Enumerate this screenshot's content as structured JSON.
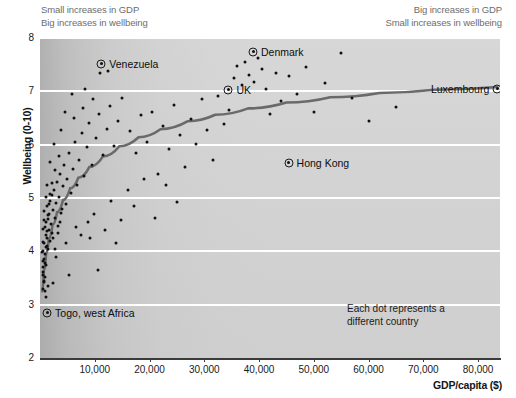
{
  "chart_data": {
    "type": "scatter",
    "title": "",
    "xlabel": "GDP/capita ($)",
    "ylabel": "Wellbeing (0-10)",
    "xlim": [
      0,
      84000
    ],
    "ylim": [
      2,
      8
    ],
    "grid": true,
    "xticks": [
      10000,
      20000,
      30000,
      40000,
      50000,
      60000,
      70000,
      80000
    ],
    "xticklabels": [
      "10,000",
      "20,000",
      "30,000",
      "40,000",
      "50,000",
      "60,000",
      "70,000",
      "80,000"
    ],
    "yticks": [
      2,
      3,
      4,
      5,
      6,
      7,
      8
    ],
    "yticklabels": [
      "2",
      "3",
      "4",
      "5",
      "6",
      "7",
      "8"
    ],
    "annotations": {
      "top_left": [
        "Small increases in GDP",
        "Big increases in wellbeing"
      ],
      "top_right": [
        "Big increases in GDP",
        "Small increases in wellbeing"
      ],
      "footnote": [
        "Each dot represents a",
        "different country"
      ]
    },
    "highlighted_points": [
      {
        "label": "Venezuela",
        "x": 11200,
        "y": 7.52,
        "label_side": "right"
      },
      {
        "label": "Denkmark_typo_fix",
        "x": 38900,
        "y": 7.74,
        "label_side": "right"
      },
      {
        "label": "UK",
        "x": 34400,
        "y": 7.03,
        "label_side": "right"
      },
      {
        "label": "Hong Kong",
        "x": 45400,
        "y": 5.66,
        "label_side": "right"
      },
      {
        "label": "Luxembourg",
        "x": 83500,
        "y": 7.05,
        "label_side": "left"
      },
      {
        "label": "Togo, west Africa",
        "x": 1300,
        "y": 2.85,
        "label_side": "right"
      }
    ],
    "highlighted_labels": [
      "Venezuela",
      "Denmark",
      "UK",
      "Hong Kong",
      "Luxembourg",
      "Togo, west Africa"
    ],
    "trend_curve": {
      "description": "logarithmic best-fit",
      "points": [
        [
          400,
          3.25
        ],
        [
          700,
          3.62
        ],
        [
          1100,
          3.95
        ],
        [
          1600,
          4.23
        ],
        [
          2300,
          4.5
        ],
        [
          3100,
          4.73
        ],
        [
          4200,
          4.96
        ],
        [
          5500,
          5.18
        ],
        [
          7000,
          5.38
        ],
        [
          9000,
          5.58
        ],
        [
          11500,
          5.78
        ],
        [
          14500,
          5.97
        ],
        [
          18000,
          6.14
        ],
        [
          22000,
          6.29
        ],
        [
          27000,
          6.44
        ],
        [
          32000,
          6.56
        ],
        [
          38000,
          6.68
        ],
        [
          45000,
          6.79
        ],
        [
          53000,
          6.89
        ],
        [
          62000,
          6.97
        ],
        [
          72000,
          7.03
        ],
        [
          83500,
          7.08
        ]
      ]
    },
    "points": [
      [
        500,
        3.3
      ],
      [
        600,
        3.55
      ],
      [
        550,
        3.7
      ],
      [
        700,
        3.85
      ],
      [
        620,
        4.0
      ],
      [
        800,
        3.45
      ],
      [
        900,
        3.95
      ],
      [
        750,
        4.15
      ],
      [
        1000,
        4.3
      ],
      [
        850,
        4.45
      ],
      [
        1100,
        3.75
      ],
      [
        1200,
        4.1
      ],
      [
        1050,
        4.55
      ],
      [
        1300,
        4.25
      ],
      [
        1400,
        4.6
      ],
      [
        1250,
        4.85
      ],
      [
        1500,
        4.05
      ],
      [
        1600,
        4.4
      ],
      [
        1700,
        4.7
      ],
      [
        1800,
        4.95
      ],
      [
        1900,
        4.2
      ],
      [
        2000,
        4.52
      ],
      [
        2100,
        5.05
      ],
      [
        2200,
        4.35
      ],
      [
        2300,
        4.78
      ],
      [
        2500,
        5.15
      ],
      [
        2700,
        4.62
      ],
      [
        2900,
        4.9
      ],
      [
        3100,
        5.3
      ],
      [
        3300,
        4.48
      ],
      [
        3500,
        5.02
      ],
      [
        3700,
        5.45
      ],
      [
        3900,
        4.72
      ],
      [
        4100,
        5.22
      ],
      [
        4400,
        5.62
      ],
      [
        4700,
        4.88
      ],
      [
        5000,
        5.35
      ],
      [
        5300,
        5.85
      ],
      [
        5600,
        5.1
      ],
      [
        6000,
        5.55
      ],
      [
        6400,
        6.05
      ],
      [
        6800,
        5.25
      ],
      [
        7200,
        5.72
      ],
      [
        7600,
        6.22
      ],
      [
        8000,
        5.42
      ],
      [
        8500,
        5.95
      ],
      [
        9000,
        6.4
      ],
      [
        9500,
        5.62
      ],
      [
        10200,
        6.12
      ],
      [
        10800,
        6.58
      ],
      [
        11500,
        5.8
      ],
      [
        12200,
        6.3
      ],
      [
        12800,
        6.72
      ],
      [
        13500,
        5.98
      ],
      [
        14200,
        6.45
      ],
      [
        15000,
        6.88
      ],
      [
        11000,
        7.35
      ],
      [
        12400,
        7.38
      ],
      [
        4800,
        4.15
      ],
      [
        5200,
        3.55
      ],
      [
        3000,
        3.9
      ],
      [
        2400,
        3.4
      ],
      [
        1450,
        3.35
      ],
      [
        900,
        3.25
      ],
      [
        1150,
        3.15
      ],
      [
        6600,
        4.45
      ],
      [
        7400,
        4.3
      ],
      [
        8800,
        4.55
      ],
      [
        9800,
        4.7
      ],
      [
        11800,
        4.4
      ],
      [
        13000,
        4.95
      ],
      [
        14800,
        4.58
      ],
      [
        16500,
        6.25
      ],
      [
        17500,
        5.85
      ],
      [
        18500,
        6.55
      ],
      [
        19500,
        6.05
      ],
      [
        20500,
        6.62
      ],
      [
        21500,
        5.45
      ],
      [
        22500,
        6.35
      ],
      [
        23500,
        5.92
      ],
      [
        24500,
        6.75
      ],
      [
        25500,
        6.18
      ],
      [
        26500,
        5.58
      ],
      [
        27500,
        6.48
      ],
      [
        28500,
        6.02
      ],
      [
        29500,
        6.85
      ],
      [
        30500,
        6.28
      ],
      [
        31500,
        5.72
      ],
      [
        32500,
        6.92
      ],
      [
        33500,
        6.38
      ],
      [
        34500,
        6.65
      ],
      [
        35500,
        7.25
      ],
      [
        36000,
        7.48
      ],
      [
        36800,
        7.12
      ],
      [
        37500,
        7.55
      ],
      [
        38200,
        7.3
      ],
      [
        39000,
        7.18
      ],
      [
        39800,
        7.62
      ],
      [
        40500,
        7.42
      ],
      [
        41200,
        7.05
      ],
      [
        42000,
        6.58
      ],
      [
        43000,
        7.35
      ],
      [
        44000,
        6.82
      ],
      [
        45500,
        7.28
      ],
      [
        47000,
        6.95
      ],
      [
        48500,
        7.45
      ],
      [
        50000,
        6.62
      ],
      [
        52000,
        7.15
      ],
      [
        55000,
        7.72
      ],
      [
        57000,
        6.88
      ],
      [
        60000,
        6.45
      ],
      [
        65000,
        6.7
      ],
      [
        16000,
        5.15
      ],
      [
        17200,
        4.85
      ],
      [
        19000,
        5.35
      ],
      [
        21000,
        4.62
      ],
      [
        23000,
        5.25
      ],
      [
        25000,
        4.92
      ],
      [
        9200,
        4.25
      ],
      [
        10500,
        3.65
      ],
      [
        13800,
        4.15
      ],
      [
        2800,
        5.52
      ],
      [
        3400,
        5.78
      ],
      [
        6200,
        6.5
      ],
      [
        7800,
        6.68
      ],
      [
        5800,
        6.95
      ],
      [
        8200,
        7.05
      ],
      [
        9600,
        6.85
      ],
      [
        4500,
        6.62
      ],
      [
        3800,
        6.28
      ],
      [
        2600,
        6.02
      ],
      [
        1900,
        5.68
      ],
      [
        1350,
        5.25
      ],
      [
        1000,
        5.02
      ],
      [
        780,
        4.75
      ],
      [
        640,
        4.58
      ],
      [
        520,
        4.42
      ],
      [
        460,
        4.18
      ],
      [
        420,
        3.98
      ],
      [
        480,
        3.82
      ],
      [
        560,
        3.62
      ],
      [
        680,
        3.42
      ],
      [
        820,
        3.52
      ],
      [
        960,
        3.78
      ],
      [
        1120,
        4.08
      ],
      [
        1280,
        4.38
      ],
      [
        1480,
        4.68
      ],
      [
        1680,
        4.88
      ],
      [
        1880,
        5.08
      ],
      [
        2150,
        5.28
      ],
      [
        2450,
        4.25
      ],
      [
        2750,
        4.05
      ],
      [
        3200,
        4.35
      ],
      [
        3600,
        4.55
      ],
      [
        4000,
        4.8
      ]
    ]
  }
}
